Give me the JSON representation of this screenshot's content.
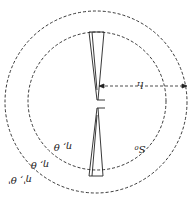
{
  "diagram": {
    "orientation": "rotated-180",
    "labels": {
      "inner_region": "η, θ",
      "middle_region": "η, θ",
      "outer_region": "η', θ'",
      "sphere": "S₀",
      "radius": "l₁"
    },
    "colors": {
      "line": "#222222",
      "background": "#ffffff"
    }
  }
}
